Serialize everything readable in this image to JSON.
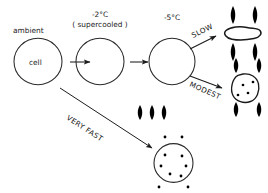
{
  "diagram": {
    "stroke_color": "#222222",
    "ice_color": "#000000",
    "background": "#ffffff"
  },
  "stages": [
    {
      "id": "ambient",
      "temp_label": "ambient",
      "inner_label": "cell",
      "state": "unfrozen cell at ambient temperature"
    },
    {
      "id": "supercooled",
      "temp_label": "-2°C",
      "sub_label": "( supercooled )",
      "inner_label": "",
      "state": "supercooled, no ice"
    },
    {
      "id": "minus5",
      "temp_label": "-5°C",
      "inner_label": "",
      "state": "extracellular ice nucleation point"
    }
  ],
  "outcomes": [
    {
      "id": "slow",
      "rate_label": "SLOW",
      "description": "dehydrated shrunken cell surrounded by extracellular ice",
      "ice_crystals": 4,
      "intracellular_ice": 0
    },
    {
      "id": "modest",
      "rate_label": "MODEST",
      "description": "partially shrunken cell with some intracellular ice",
      "ice_crystals": 4,
      "intracellular_ice": 4
    },
    {
      "id": "very-fast",
      "rate_label": "VERY FAST",
      "description": "round cell filled with intracellular ice",
      "ice_crystals": 3,
      "intracellular_ice": 6
    }
  ]
}
